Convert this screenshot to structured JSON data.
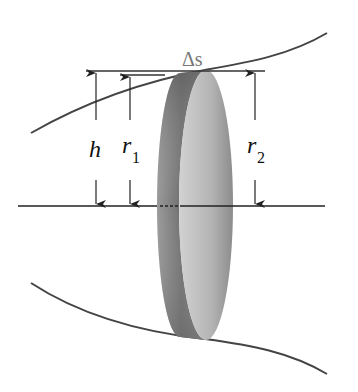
{
  "figure": {
    "labels": {
      "delta_s": "Δs",
      "h": "h",
      "r1_main": "r",
      "r1_sub": "1",
      "r2_main": "r",
      "r2_sub": "2"
    },
    "colors": {
      "line": "#333333",
      "curve": "#444444",
      "disk_light": "#c8c8c8",
      "disk_dark": "#6a6a6a",
      "label_delta": "#777777"
    }
  }
}
